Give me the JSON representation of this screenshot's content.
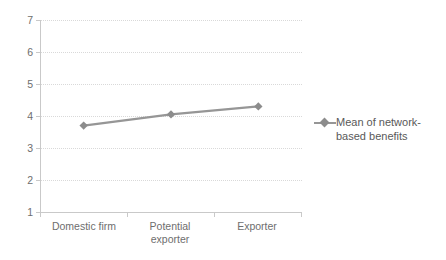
{
  "chart_data": {
    "type": "line",
    "title": "",
    "subtitle": "",
    "xlabel": "",
    "ylabel": "",
    "categories": [
      "Domestic firm",
      "Potential exporter",
      "Exporter"
    ],
    "series": [
      {
        "name": "Mean of network-based benefits",
        "values": [
          3.7,
          4.05,
          4.3
        ],
        "color": "#969696",
        "marker": "diamond",
        "marker_color": "#8c8c8c"
      }
    ],
    "ylim": [
      1,
      7
    ],
    "y_ticks": [
      1,
      2,
      3,
      4,
      5,
      6,
      7
    ],
    "y_tick_labels": [
      "1",
      "2",
      "3",
      "4",
      "5",
      "6",
      "7"
    ],
    "grid": "horizontal-dotted",
    "grid_color": "#d9d9d9",
    "legend_position": "right",
    "legend_entries": [
      "Mean of network-based benefits"
    ],
    "axis_color": "#c9c9c9",
    "tick_label_color": "#6e6e6e",
    "background": "#ffffff"
  },
  "legend": {
    "line1": "Mean of network-",
    "line2": "based benefits",
    "full_label": "Mean of network-based benefits"
  },
  "x_axis": {
    "labels": [
      {
        "line1": "Domestic firm",
        "line2": ""
      },
      {
        "line1": "Potential",
        "line2": "exporter"
      },
      {
        "line1": "Exporter",
        "line2": ""
      }
    ]
  },
  "y_axis": {
    "labels": [
      "7",
      "6",
      "5",
      "4",
      "3",
      "2",
      "1"
    ]
  }
}
